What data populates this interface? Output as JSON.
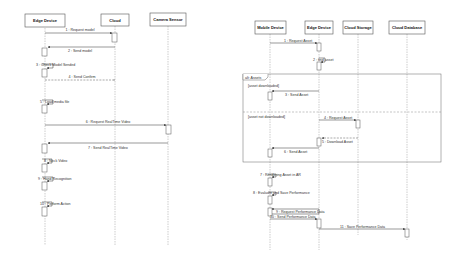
{
  "diagrams": [
    {
      "name": "left-sequence",
      "participants": [
        "Edge Device",
        "Cloud",
        "Camera Sensor"
      ],
      "messages": [
        {
          "label": "1 : Request model"
        },
        {
          "label": "2 : Send model"
        },
        {
          "label": "3 : Check Model Sended"
        },
        {
          "label": "4 : Send Confirm"
        },
        {
          "label": "5 : Load media file"
        },
        {
          "label": "6 : Request RealTime Video"
        },
        {
          "label": "7 : Send RealTime Video"
        },
        {
          "label": "8 : Neck Video"
        },
        {
          "label": "9 : Hand Recognition"
        },
        {
          "label": "10 : Perform Action"
        }
      ]
    },
    {
      "name": "right-sequence",
      "participants": [
        "Mobile Device",
        "Edge Device",
        "Cloud Storage",
        "Cloud Database"
      ],
      "frame": {
        "operator": "alt: Assets",
        "guards": [
          "[asset downloaded]",
          "[asset not downloaded]"
        ]
      },
      "messages": [
        {
          "label": "1 : Request Asset"
        },
        {
          "label": "2 : find asset"
        },
        {
          "label": "3 : Send Asset"
        },
        {
          "label": "4 : Request Asset"
        },
        {
          "label": "5 : Download Asset"
        },
        {
          "label": "6 : Send Asset"
        },
        {
          "label": "7 : Rendering Asset in AR"
        },
        {
          "label": "8 : Evaluate and Save Performance"
        },
        {
          "label": "9 : Request Performance Data"
        },
        {
          "label": "10 : Send Performance Data"
        },
        {
          "label": "11 : Save Performance Data"
        }
      ]
    }
  ]
}
